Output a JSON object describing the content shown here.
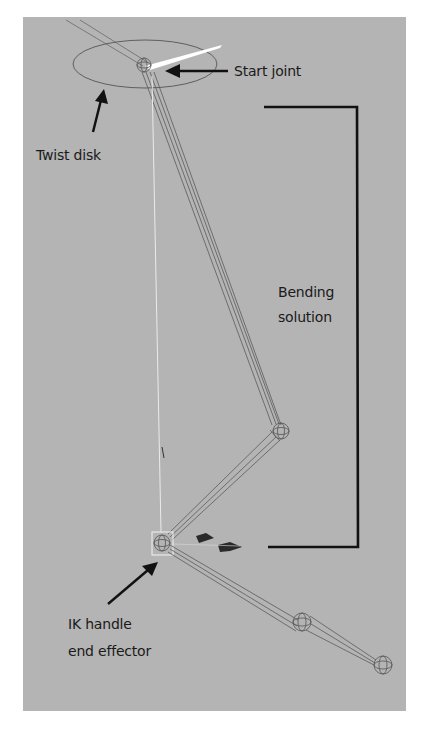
{
  "figure": {
    "background_color": "#b4b4b4",
    "annotation_color": "#111111",
    "rig_line_color": "#5a5a5a",
    "highlight_color": "#ffffff"
  },
  "labels": {
    "start_joint": "Start joint",
    "twist_disk": "Twist disk",
    "bending_solution_line1": "Bending",
    "bending_solution_line2": "solution",
    "ik_handle_line1": "IK handle",
    "ik_handle_line2": "end effector"
  }
}
